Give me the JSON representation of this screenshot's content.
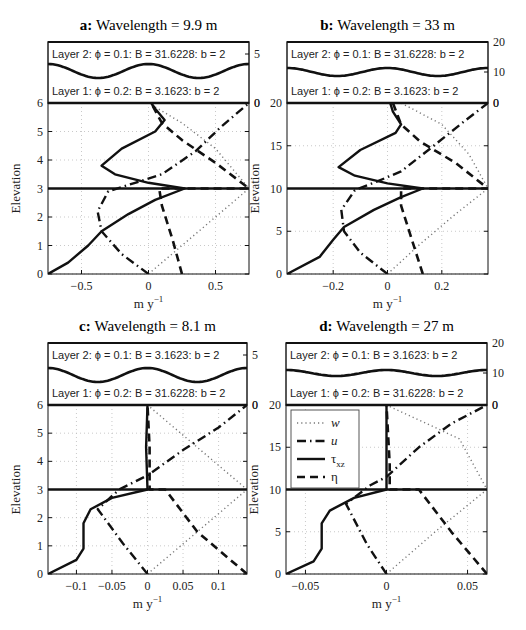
{
  "figure": {
    "ylabel": "Elevation",
    "xlabel": "m y",
    "xlabel_sup": "−1",
    "legend": [
      {
        "label": "w",
        "style": "dotted"
      },
      {
        "label": "u",
        "style": "dash-dot"
      },
      {
        "label": "τ",
        "sub": "xz",
        "style": "solid"
      },
      {
        "label": "η",
        "style": "dashed"
      }
    ]
  },
  "panels": [
    {
      "id": "a",
      "letter": "a:",
      "title": "Wavelength = 9.9 m",
      "layer2": "Layer 2: ϕ = 0.1:  B = 31.6228:  b = 2",
      "layer1": "Layer 1: ϕ = 0.2:  B = 3.1623:  b = 2",
      "right_ticks": [
        "5",
        "0"
      ],
      "yticks": [
        "0",
        "1",
        "2",
        "3",
        "4",
        "5",
        "6"
      ],
      "xticks": [
        "−0.5",
        "0",
        "0.5"
      ]
    },
    {
      "id": "b",
      "letter": "b:",
      "title": "Wavelength = 33 m",
      "layer2": "Layer 2: ϕ = 0.1:  B = 31.6228:  b = 2",
      "layer1": "Layer 1: ϕ = 0.2:  B = 3.1623:  b = 2",
      "right_ticks": [
        "20",
        "10",
        "0"
      ],
      "yticks": [
        "0",
        "5",
        "10",
        "15",
        "20"
      ],
      "xticks": [
        "−0.2",
        "0",
        "0.2"
      ]
    },
    {
      "id": "c",
      "letter": "c:",
      "title": "Wavelength = 8.1 m",
      "layer2": "Layer 2: ϕ = 0.1:  B = 3.1623:  b = 2",
      "layer1": "Layer 1: ϕ = 0.2:  B = 31.6228:  b = 2",
      "right_ticks": [
        "5",
        "0"
      ],
      "yticks": [
        "0",
        "1",
        "2",
        "3",
        "4",
        "5",
        "6"
      ],
      "xticks": [
        "−0.1",
        "−0.05",
        "0",
        "0.05",
        "0.1"
      ]
    },
    {
      "id": "d",
      "letter": "d:",
      "title": "Wavelength = 27 m",
      "layer2": "Layer 2: ϕ = 0.1:  B = 3.1623:  b = 2",
      "layer1": "Layer 1: ϕ = 0.2:  B = 31.6228:  b = 2",
      "right_ticks": [
        "20",
        "10",
        "0"
      ],
      "yticks": [
        "0",
        "5",
        "10",
        "15",
        "20"
      ],
      "xticks": [
        "−0.05",
        "0",
        "0.05"
      ]
    }
  ],
  "chart_data": [
    {
      "type": "line",
      "title": "a: Wavelength = 9.9 m",
      "xlabel": "m y^-1",
      "ylabel": "Elevation",
      "xlim": [
        -0.75,
        0.75
      ],
      "ylim": [
        0,
        6
      ],
      "grid": true,
      "legend_position": "none",
      "layer_interface": 3,
      "series": [
        {
          "name": "w",
          "style": "dotted",
          "x": [
            0,
            0.25,
            0.5,
            0.75,
            0.5,
            0.25,
            0
          ],
          "y": [
            0,
            1,
            2,
            3,
            4.4,
            5.3,
            6
          ]
        },
        {
          "name": "u",
          "style": "dash-dot",
          "x": [
            0,
            -0.2,
            -0.35,
            -0.38,
            -0.3,
            -0.1,
            0.1,
            0.35,
            0.55,
            0.75
          ],
          "y": [
            0,
            0.7,
            1.5,
            2.2,
            2.9,
            3.2,
            3.5,
            4.3,
            5.2,
            6
          ]
        },
        {
          "name": "tau_xz",
          "style": "solid",
          "x": [
            -0.75,
            -0.6,
            -0.45,
            -0.35,
            -0.15,
            0.05,
            0.27,
            0,
            -0.25,
            -0.35,
            -0.2,
            0.05,
            0.12,
            0.05,
            0.02
          ],
          "y": [
            0,
            0.4,
            1.0,
            1.5,
            2.1,
            2.6,
            3.0,
            3.2,
            3.5,
            3.8,
            4.4,
            5.0,
            5.4,
            5.8,
            6
          ]
        },
        {
          "name": "eta",
          "style": "dashed",
          "x": [
            0.25,
            0.18,
            0.1,
            0.08,
            0.75,
            0.5,
            0.25,
            0.1,
            0.02
          ],
          "y": [
            0,
            1.2,
            2.4,
            3.0,
            3.0,
            3.9,
            4.7,
            5.3,
            6
          ]
        }
      ]
    },
    {
      "type": "line",
      "title": "b: Wavelength = 33 m",
      "xlabel": "m y^-1",
      "ylabel": "Elevation",
      "xlim": [
        -0.37,
        0.37
      ],
      "ylim": [
        0,
        20
      ],
      "grid": true,
      "legend_position": "none",
      "layer_interface": 10,
      "series": [
        {
          "name": "w",
          "style": "dotted",
          "x": [
            0,
            0.12,
            0.25,
            0.37,
            0.3,
            0.2,
            0.05
          ],
          "y": [
            0,
            3.5,
            7,
            10,
            14,
            17.5,
            20
          ]
        },
        {
          "name": "u",
          "style": "dash-dot",
          "x": [
            0,
            -0.1,
            -0.16,
            -0.17,
            -0.12,
            -0.04,
            0.05,
            0.17,
            0.28,
            0.37
          ],
          "y": [
            0,
            2.5,
            5,
            7.5,
            9.8,
            10.8,
            12,
            15,
            17.8,
            20
          ]
        },
        {
          "name": "tau_xz",
          "style": "solid",
          "x": [
            -0.37,
            -0.25,
            -0.2,
            -0.16,
            -0.05,
            0.05,
            0.13,
            0.0,
            -0.12,
            -0.18,
            -0.1,
            0.03,
            0.05,
            0.02,
            0.01
          ],
          "y": [
            0,
            2,
            4,
            5.5,
            7.5,
            9,
            10,
            10.6,
            11.5,
            12.5,
            14.5,
            16.5,
            17.5,
            19,
            20
          ]
        },
        {
          "name": "eta",
          "style": "dashed",
          "x": [
            0.13,
            0.09,
            0.05,
            0.05,
            0.37,
            0.25,
            0.12,
            0.05,
            0.02
          ],
          "y": [
            0,
            4,
            8,
            10,
            10,
            13,
            15.5,
            17.5,
            20
          ]
        }
      ]
    },
    {
      "type": "line",
      "title": "c: Wavelength = 8.1 m",
      "xlabel": "m y^-1",
      "ylabel": "Elevation",
      "xlim": [
        -0.14,
        0.14
      ],
      "ylim": [
        0,
        6
      ],
      "grid": true,
      "legend_position": "none",
      "layer_interface": 3,
      "series": [
        {
          "name": "w",
          "style": "dotted",
          "x": [
            0,
            0.07,
            0.14,
            0.07,
            0
          ],
          "y": [
            0,
            1.5,
            3,
            4.5,
            6
          ]
        },
        {
          "name": "u",
          "style": "dash-dot",
          "x": [
            0,
            -0.035,
            -0.07,
            -0.04,
            0,
            0.05,
            0.1,
            0.14
          ],
          "y": [
            0,
            1.1,
            2.3,
            3.0,
            3.5,
            4.4,
            5.2,
            6
          ]
        },
        {
          "name": "tau_xz",
          "style": "solid",
          "x": [
            -0.14,
            -0.1,
            -0.09,
            -0.09,
            -0.08,
            -0.05,
            0,
            -0.002,
            0.0
          ],
          "y": [
            0,
            0.5,
            0.9,
            1.8,
            2.3,
            2.7,
            3.0,
            4.5,
            6
          ]
        },
        {
          "name": "eta",
          "style": "dashed",
          "x": [
            0.14,
            0.07,
            0.025,
            0.003,
            0.003,
            0.0
          ],
          "y": [
            0,
            1.5,
            3.0,
            3.0,
            4.5,
            6
          ]
        }
      ]
    },
    {
      "type": "line",
      "title": "d: Wavelength = 27 m",
      "xlabel": "m y^-1",
      "ylabel": "Elevation",
      "xlim": [
        -0.062,
        0.062
      ],
      "ylim": [
        0,
        20
      ],
      "grid": true,
      "legend_position": "upper left",
      "layer_interface": 10,
      "series": [
        {
          "name": "w",
          "style": "dotted",
          "x": [
            0,
            0.03,
            0.062,
            0.045,
            0.0
          ],
          "y": [
            0,
            5,
            10,
            16,
            20
          ]
        },
        {
          "name": "u",
          "style": "dash-dot",
          "x": [
            0,
            -0.012,
            -0.025,
            -0.01,
            0,
            0.02,
            0.04,
            0.062
          ],
          "y": [
            0,
            3.5,
            8.3,
            10.5,
            11.5,
            15,
            17.8,
            20
          ]
        },
        {
          "name": "tau_xz",
          "style": "solid",
          "x": [
            -0.062,
            -0.045,
            -0.04,
            -0.04,
            -0.035,
            -0.02,
            0,
            0.0
          ],
          "y": [
            0,
            1.5,
            3,
            6,
            7.5,
            9,
            10,
            20
          ]
        },
        {
          "name": "eta",
          "style": "dashed",
          "x": [
            0.062,
            0.04,
            0.02,
            0.002,
            0.002,
            0.0
          ],
          "y": [
            0,
            5,
            10,
            10,
            13,
            20
          ]
        }
      ]
    }
  ]
}
